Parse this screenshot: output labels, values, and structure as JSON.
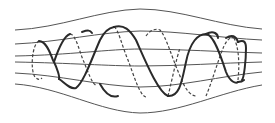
{
  "diagram": {
    "colors": {
      "background": "#ffffff",
      "field_line": "#555555",
      "helix": "#2a2a2a"
    },
    "field_lines": [
      {
        "d": "M15,30 C60,28 100,10 140,9 C180,9 220,26 262,29"
      },
      {
        "d": "M15,44 C60,42 100,32 140,31 C180,31 220,38 262,40"
      },
      {
        "d": "M15,56 C70,55 110,49 140,49 C180,49 220,52 262,53"
      },
      {
        "d": "M15,62 C70,63 110,66 140,66 C180,66 220,63 262,62"
      },
      {
        "d": "M15,73 C60,75 100,86 140,87 C180,87 220,76 262,72"
      },
      {
        "d": "M15,84 C60,87 100,112 140,113 C180,113 220,92 262,85"
      }
    ],
    "helix_front": [
      "M39,41 C48,41 52,60 54,62 C57,68 60,77 59,79",
      "M54,62 C58,50 64,36 70,34",
      "M59,79 C64,82 70,90 76,88 C84,82 92,58 100,40 C104,32 108,28 114,27",
      "M82,32 C88,30 90,30 92,33",
      "M114,27 C124,24 130,30 136,40 C145,60 158,92 168,96",
      "M100,84 C106,95 112,98 118,96",
      "M168,96 C180,97 182,80 186,62 C190,42 198,34 206,34 C214,34 222,60 226,72 C230,82 236,84 238,82",
      "M206,34 C214,30 218,34 218,38",
      "M226,38 C232,34 236,36 238,42",
      "M238,42 C242,40 246,40 246,48 C246,60 244,78 242,80",
      "M238,82 C242,82 244,80 244,80"
    ],
    "helix_back": [
      "M39,41 C32,44 30,70 35,77 C38,80 40,80 42,78",
      "M70,34 C76,34 80,54 84,62 C88,72 92,84 97,86",
      "M114,27 C118,28 122,46 128,60 C134,76 140,96 146,97",
      "M168,96 C172,80 176,60 180,48",
      "M146,36 C150,30 156,28 160,30 C166,36 172,58 180,76 C186,92 192,96 196,96",
      "M206,96 C212,82 218,60 224,46 C228,38 232,36 234,38",
      "M234,38 C238,46 240,60 238,80"
    ]
  }
}
